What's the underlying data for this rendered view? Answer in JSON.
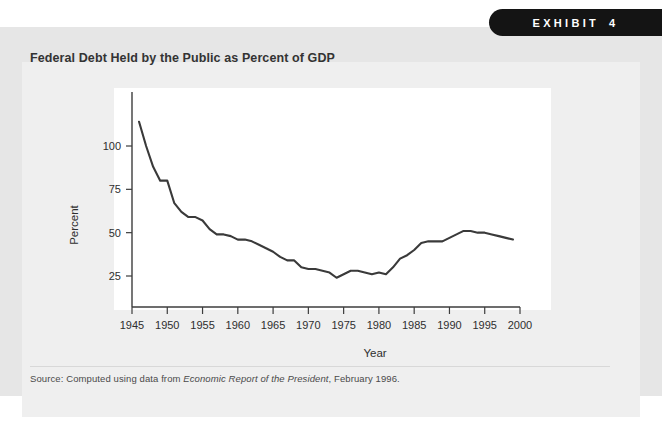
{
  "page": {
    "top_sliver_text": "",
    "background_color": "#ffffff",
    "frame_color": "#e6e6e6",
    "card_color": "#efefef"
  },
  "exhibit_tag": {
    "word": "EXHIBIT",
    "number": "4",
    "background_color": "#141414",
    "text_color": "#ffffff"
  },
  "title": "Federal Debt Held by the Public as Percent of GDP",
  "source": {
    "prefix": "Source: Computed using data from ",
    "italic": "Economic Report of the President",
    "suffix": ", February 1996."
  },
  "chart_data": {
    "type": "line",
    "title": "Federal Debt Held by the Public as Percent of GDP",
    "xlabel": "Year",
    "ylabel": "Percent",
    "xlim": [
      1945,
      2000
    ],
    "ylim": [
      0,
      120
    ],
    "grid": false,
    "legend": null,
    "line_color": "#3a3a3a",
    "xticks": [
      1945,
      1950,
      1955,
      1960,
      1965,
      1970,
      1975,
      1980,
      1985,
      1990,
      1995,
      2000
    ],
    "xtick_labels": [
      "1945",
      "1950",
      "1955",
      "1960",
      "1965",
      "1970",
      "1975",
      "1980",
      "1985",
      "1990",
      "1995",
      "2000"
    ],
    "yticks": [
      25,
      50,
      75,
      100
    ],
    "ytick_labels": [
      "25",
      "50",
      "75",
      "100"
    ],
    "series": [
      {
        "name": "Federal debt held by the public (% of GDP)",
        "x": [
          1946,
          1947,
          1948,
          1949,
          1950,
          1951,
          1952,
          1953,
          1954,
          1955,
          1956,
          1957,
          1958,
          1959,
          1960,
          1961,
          1962,
          1963,
          1964,
          1965,
          1966,
          1967,
          1968,
          1969,
          1970,
          1971,
          1972,
          1973,
          1974,
          1975,
          1976,
          1977,
          1978,
          1979,
          1980,
          1981,
          1982,
          1983,
          1984,
          1985,
          1986,
          1987,
          1988,
          1989,
          1990,
          1991,
          1992,
          1993,
          1994,
          1995,
          1996,
          1997,
          1998,
          1999
        ],
        "values": [
          114,
          100,
          88,
          80,
          80,
          67,
          62,
          59,
          59,
          57,
          52,
          49,
          49,
          48,
          46,
          46,
          45,
          43,
          41,
          39,
          36,
          34,
          34,
          30,
          29,
          29,
          28,
          27,
          24,
          26,
          28,
          28,
          27,
          26,
          27,
          26,
          30,
          35,
          37,
          40,
          44,
          45,
          45,
          45,
          47,
          49,
          51,
          51,
          50,
          50,
          49,
          48,
          47,
          46
        ]
      }
    ],
    "plot_area_px": {
      "x_axis_left_px": 132,
      "x_axis_right_px": 520,
      "y_100_px": 146,
      "y_25_px": 276
    }
  }
}
